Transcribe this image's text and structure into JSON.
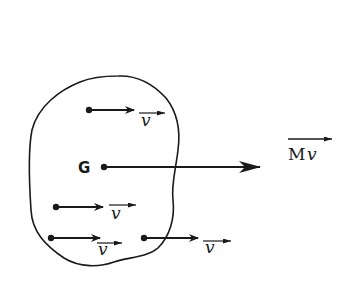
{
  "diagram": {
    "title": "",
    "colors": {
      "ink": "#1a1a1a",
      "background": "#ffffff"
    },
    "body": {
      "name": "rigid-body-outline"
    },
    "center_of_mass": {
      "label": "G",
      "x": 104,
      "y": 167
    },
    "resultant": {
      "label_M": "M",
      "label_v": "v",
      "from": [
        104,
        167
      ],
      "to": [
        260,
        167
      ]
    },
    "velocity_vectors": [
      {
        "label": "v",
        "from": [
          89,
          110
        ],
        "to": [
          134,
          110
        ],
        "label_pos": [
          141,
          122
        ]
      },
      {
        "label": "v",
        "from": [
          56,
          207
        ],
        "to": [
          103,
          207
        ],
        "label_pos": [
          110,
          218
        ]
      },
      {
        "label": "v",
        "from": [
          51,
          238
        ],
        "to": [
          100,
          238
        ],
        "label_pos": [
          97,
          253
        ]
      },
      {
        "label": "v",
        "from": [
          144,
          238
        ],
        "to": [
          198,
          238
        ],
        "label_pos": [
          205,
          251
        ]
      }
    ]
  }
}
